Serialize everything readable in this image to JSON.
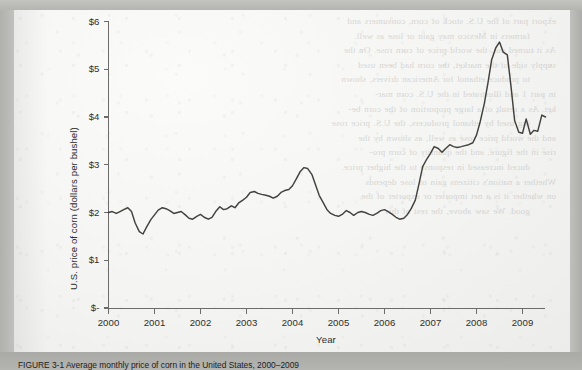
{
  "page": {
    "caption": "FIGURE 3-1   Average monthly price of corn in the United States, 2000–2009"
  },
  "showthrough_lines": [
    "export part of the U.S. stock of corn, consumers and",
    "farmers in Mexico may gain or lose as well.",
    "As it turned out, the world price of corn rose. On the",
    "supply side of the market, the corn had been used",
    "to produce ethanol for American drivers, shown",
    "in part 1 and illustrated in the U.S. corn mar-",
    "ket. As a result of a large proportion of the corn be-",
    "ing used by ethanol producers, the U.S. price rose",
    "and the world price rose as well, as shown by the",
    "rise in the figure, and the quantity of corn pro-",
    "duced increased in response to the higher price.",
    "Whether a nation's citizens gain or lose depends",
    "on whether it is a net importer or exporter of the",
    "good. We saw above, the rest of this"
  ],
  "chart_data": {
    "type": "line",
    "title": "",
    "xlabel": "Year",
    "ylabel": "U.S. price of corn (dollars per bushel)",
    "xlim": [
      2000,
      2009.9
    ],
    "ylim": [
      0,
      6
    ],
    "grid": false,
    "legend": "none",
    "line_color": "#33322f",
    "x_ticks": [
      "2000",
      "2001",
      "2002",
      "2003",
      "2004",
      "2005",
      "2006",
      "2007",
      "2008",
      "2009"
    ],
    "x_tick_values": [
      2000,
      2001,
      2002,
      2003,
      2004,
      2005,
      2006,
      2007,
      2008,
      2009
    ],
    "y_ticks": [
      "$-",
      "$1",
      "$2",
      "$3",
      "$4",
      "$5",
      "$6"
    ],
    "y_tick_values": [
      0,
      1,
      2,
      3,
      4,
      5,
      6
    ],
    "series": [
      {
        "name": "U.S. price of corn",
        "x": [
          2000.0,
          2000.08,
          2000.17,
          2000.25,
          2000.33,
          2000.42,
          2000.5,
          2000.58,
          2000.67,
          2000.75,
          2000.83,
          2000.92,
          2001.0,
          2001.08,
          2001.17,
          2001.25,
          2001.33,
          2001.42,
          2001.5,
          2001.58,
          2001.67,
          2001.75,
          2001.83,
          2001.92,
          2002.0,
          2002.08,
          2002.17,
          2002.25,
          2002.33,
          2002.42,
          2002.5,
          2002.58,
          2002.67,
          2002.75,
          2002.83,
          2002.92,
          2003.0,
          2003.08,
          2003.17,
          2003.25,
          2003.33,
          2003.42,
          2003.5,
          2003.58,
          2003.67,
          2003.75,
          2003.83,
          2003.92,
          2004.0,
          2004.08,
          2004.17,
          2004.25,
          2004.33,
          2004.42,
          2004.5,
          2004.58,
          2004.67,
          2004.75,
          2004.83,
          2004.92,
          2005.0,
          2005.08,
          2005.17,
          2005.25,
          2005.33,
          2005.42,
          2005.5,
          2005.58,
          2005.67,
          2005.75,
          2005.83,
          2005.92,
          2006.0,
          2006.08,
          2006.17,
          2006.25,
          2006.33,
          2006.42,
          2006.5,
          2006.58,
          2006.67,
          2006.75,
          2006.83,
          2006.92,
          2007.0,
          2007.08,
          2007.17,
          2007.25,
          2007.33,
          2007.42,
          2007.5,
          2007.58,
          2007.67,
          2007.75,
          2007.83,
          2007.92,
          2008.0,
          2008.08,
          2008.17,
          2008.25,
          2008.33,
          2008.42,
          2008.5,
          2008.58,
          2008.67,
          2008.75,
          2008.83,
          2008.92,
          2009.0,
          2009.08,
          2009.17,
          2009.25,
          2009.33,
          2009.42,
          2009.5
        ],
        "y": [
          2.0,
          2.02,
          1.98,
          2.02,
          2.06,
          2.1,
          2.02,
          1.78,
          1.6,
          1.55,
          1.7,
          1.85,
          1.95,
          2.05,
          2.1,
          2.08,
          2.04,
          1.98,
          2.0,
          2.02,
          1.95,
          1.88,
          1.86,
          1.92,
          1.96,
          1.9,
          1.86,
          1.9,
          2.02,
          2.12,
          2.06,
          2.08,
          2.14,
          2.1,
          2.2,
          2.26,
          2.32,
          2.42,
          2.44,
          2.4,
          2.38,
          2.36,
          2.34,
          2.3,
          2.34,
          2.42,
          2.46,
          2.48,
          2.56,
          2.7,
          2.86,
          2.94,
          2.92,
          2.8,
          2.58,
          2.36,
          2.2,
          2.06,
          1.98,
          1.94,
          1.92,
          1.96,
          2.04,
          2.0,
          1.94,
          2.0,
          2.02,
          2.0,
          1.96,
          1.94,
          1.98,
          2.04,
          2.06,
          2.02,
          1.96,
          1.9,
          1.86,
          1.88,
          1.96,
          2.08,
          2.26,
          2.6,
          2.96,
          3.12,
          3.24,
          3.38,
          3.34,
          3.26,
          3.34,
          3.42,
          3.38,
          3.36,
          3.38,
          3.4,
          3.42,
          3.46,
          3.62,
          3.9,
          4.28,
          4.72,
          5.2,
          5.45,
          5.57,
          5.36,
          5.3,
          4.64,
          3.92,
          3.68,
          3.66,
          3.96,
          3.64,
          3.72,
          3.7,
          4.04,
          4.0
        ]
      }
    ],
    "annotations": {
      "peak_year": "2008",
      "peak_value": "$5.57",
      "trough_year": "2000",
      "trough_value": "$1.55",
      "start_value": "$2.00",
      "end_value": "$4.00"
    }
  }
}
